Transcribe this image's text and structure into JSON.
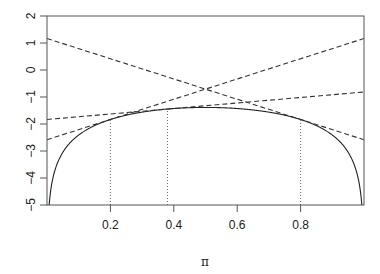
{
  "chart_data": {
    "type": "line",
    "title": "",
    "xlabel": "π",
    "ylabel": "",
    "xlim": [
      0,
      1
    ],
    "ylim": [
      -5,
      2
    ],
    "grid": false,
    "legend": null,
    "x_ticks": [
      0.2,
      0.4,
      0.6,
      0.8
    ],
    "x_tick_labels": [
      "0.2",
      "0.4",
      "0.6",
      "0.8"
    ],
    "y_ticks": [
      2,
      1,
      0,
      -1,
      -2,
      -3,
      -4,
      -5
    ],
    "y_tick_labels": [
      "2",
      "1",
      "0",
      "−1",
      "−2",
      "−3",
      "−4",
      "−5"
    ],
    "series": [
      {
        "name": "log-likelihood",
        "style": "solid",
        "function": "log(pi) + log(1 - pi)",
        "x": [
          0.001,
          0.01,
          0.05,
          0.1,
          0.2,
          0.3,
          0.38,
          0.5,
          0.62,
          0.7,
          0.8,
          0.9,
          0.95,
          0.99,
          0.999
        ],
        "values": [
          -6.909,
          -4.615,
          -3.047,
          -2.408,
          -1.833,
          -1.561,
          -1.446,
          -1.386,
          -1.446,
          -1.561,
          -1.833,
          -2.408,
          -3.047,
          -4.615,
          -6.909
        ]
      },
      {
        "name": "tangent at π=0.2",
        "style": "dashed",
        "x": [
          0,
          1
        ],
        "values": [
          -2.583,
          1.167
        ]
      },
      {
        "name": "tangent at π=0.38",
        "style": "dashed",
        "x": [
          0,
          1
        ],
        "values": [
          -1.833,
          -0.814
        ]
      },
      {
        "name": "tangent at π=0.8",
        "style": "dashed",
        "x": [
          0,
          1
        ],
        "values": [
          1.167,
          -2.583
        ]
      }
    ],
    "vertical_lines": [
      {
        "x": 0.2,
        "y_top": -1.833,
        "style": "dotted"
      },
      {
        "x": 0.38,
        "y_top": -1.446,
        "style": "dotted"
      },
      {
        "x": 0.8,
        "y_top": -1.833,
        "style": "dotted"
      }
    ]
  },
  "colors": {
    "curve": "#222222",
    "tangent": "#333333",
    "axis": "#555555"
  }
}
